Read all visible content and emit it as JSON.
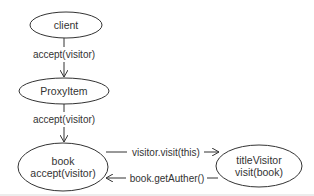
{
  "diagram": {
    "nodes": [
      {
        "id": "client",
        "lines": [
          "client"
        ]
      },
      {
        "id": "proxy",
        "lines": [
          "ProxyItem"
        ]
      },
      {
        "id": "book",
        "lines": [
          "book",
          "accept(visitor)"
        ]
      },
      {
        "id": "titleVisitor",
        "lines": [
          "titleVisitor",
          "visit(book)"
        ]
      }
    ],
    "edges": [
      {
        "from": "client",
        "to": "proxy",
        "label": "accept(visitor)"
      },
      {
        "from": "proxy",
        "to": "book",
        "label": "accept(visitor)"
      },
      {
        "from": "book",
        "to": "titleVisitor",
        "label": "visitor.visit(this)"
      },
      {
        "from": "titleVisitor",
        "to": "book",
        "label": "book.getAuther()"
      }
    ],
    "stroke_color": "#333333",
    "background": "#ffffff"
  }
}
